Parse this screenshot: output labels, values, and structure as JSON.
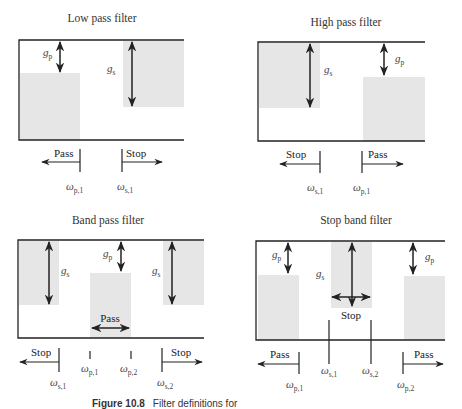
{
  "figure": {
    "caption_label": "Figure 10.8",
    "caption_text": "Filter definitions for",
    "colors": {
      "shade": "#e6e6e6",
      "line": "#222222",
      "text": "#333333"
    }
  },
  "panels": [
    {
      "id": "low-pass",
      "title": "Low pass filter",
      "gain_labels": {
        "gp": "g",
        "gp_sub": "p",
        "gs": "g",
        "gs_sub": "s"
      },
      "band_labels": {
        "left": "Pass",
        "right": "Stop"
      },
      "freq_labels": [
        {
          "sym": "ω",
          "sub": "p,1"
        },
        {
          "sym": "ω",
          "sub": "s,1"
        }
      ]
    },
    {
      "id": "high-pass",
      "title": "High pass filter",
      "gain_labels": {
        "gs": "g",
        "gs_sub": "s",
        "gp": "g",
        "gp_sub": "p"
      },
      "band_labels": {
        "left": "Stop",
        "right": "Pass"
      },
      "freq_labels": [
        {
          "sym": "ω",
          "sub": "s,1"
        },
        {
          "sym": "ω",
          "sub": "p,1"
        }
      ]
    },
    {
      "id": "band-pass",
      "title": "Band pass filter",
      "gain_labels": {
        "gs": "g",
        "gs_sub": "s",
        "gp": "g",
        "gp_sub": "p"
      },
      "band_labels": {
        "left": "Stop",
        "middle": "Pass",
        "right": "Stop"
      },
      "freq_labels": [
        {
          "sym": "ω",
          "sub": "s,1"
        },
        {
          "sym": "ω",
          "sub": "p,1"
        },
        {
          "sym": "ω",
          "sub": "p,2"
        },
        {
          "sym": "ω",
          "sub": "s,2"
        }
      ]
    },
    {
      "id": "stop-band",
      "title": "Stop band filter",
      "gain_labels": {
        "gp": "g",
        "gp_sub": "p",
        "gs": "g",
        "gs_sub": "s"
      },
      "band_labels": {
        "left": "Pass",
        "middle": "Stop",
        "right": "Pass"
      },
      "freq_labels": [
        {
          "sym": "ω",
          "sub": "p,1"
        },
        {
          "sym": "ω",
          "sub": "s,1"
        },
        {
          "sym": "ω",
          "sub": "s,2"
        },
        {
          "sym": "ω",
          "sub": "p,2"
        }
      ]
    }
  ]
}
